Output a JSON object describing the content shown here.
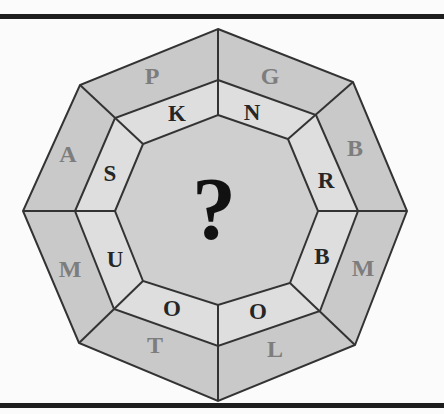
{
  "puzzle": {
    "center_symbol": "?",
    "outer_ring": [
      "G",
      "B",
      "M",
      "L",
      "T",
      "M",
      "A",
      "P"
    ],
    "inner_ring": [
      "N",
      "R",
      "B",
      "O",
      "O",
      "U",
      "S",
      "K"
    ]
  },
  "colors": {
    "outer_band": "#c9c9c9",
    "middle_band": "#dedede",
    "center": "#cfcfcf",
    "stroke": "#333333",
    "outer_letters": "#7d7d7d",
    "inner_letters": "#262626"
  }
}
